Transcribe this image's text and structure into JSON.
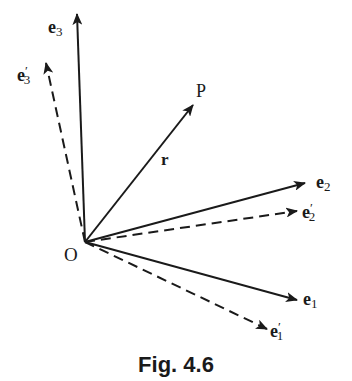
{
  "figure": {
    "caption": "Fig. 4.6",
    "origin": {
      "label": "O",
      "x": 85,
      "y": 242
    },
    "point": {
      "label": "P"
    },
    "position_vector": {
      "label": "r",
      "tip": [
        193,
        105
      ],
      "style": "solid"
    },
    "vectors": [
      {
        "id": "e3",
        "base": "e",
        "sub": "3",
        "prime": false,
        "tip": [
          77,
          14
        ],
        "style": "solid"
      },
      {
        "id": "e3p",
        "base": "e",
        "sub": "3",
        "prime": true,
        "tip": [
          46,
          63
        ],
        "style": "dashed"
      },
      {
        "id": "e2",
        "base": "e",
        "sub": "2",
        "prime": false,
        "tip": [
          305,
          183
        ],
        "style": "solid"
      },
      {
        "id": "e2p",
        "base": "e",
        "sub": "2",
        "prime": true,
        "tip": [
          297,
          211
        ],
        "style": "dashed"
      },
      {
        "id": "e1",
        "base": "e",
        "sub": "1",
        "prime": false,
        "tip": [
          297,
          300
        ],
        "style": "solid"
      },
      {
        "id": "e1p",
        "base": "e",
        "sub": "1",
        "prime": true,
        "tip": [
          267,
          329
        ],
        "style": "dashed"
      }
    ],
    "colors": {
      "ink": "#1a1a1a",
      "background": "#ffffff"
    }
  }
}
